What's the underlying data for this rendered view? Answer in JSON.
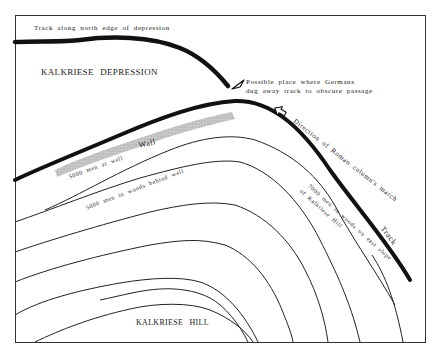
{
  "map": {
    "title": "Kalkriese battle site sketch map",
    "regions": {
      "depression": "KALKRIESE   DEPRESSION",
      "hill": "KALKRIESE   HILL"
    },
    "labels": {
      "north_track": "Track along north edge of depression",
      "possible_place_line1": "Possible place where Germans",
      "possible_place_line2": "dug away track to obscure passage",
      "direction": "Direction of Roman column's march",
      "track": "Track",
      "wall": "Wall",
      "men_at_wall": "5000 men at wall",
      "men_behind_wall": "5000 men in woods behind wall",
      "men_east_slope_line1": "7000 men in woods on east slope",
      "men_east_slope_line2": "of Kalkriese Hill"
    },
    "icons": {
      "pointer": "hollow-triangle-pointer-icon",
      "direction_arrow": "hollow-arrow-icon"
    },
    "colors": {
      "ink": "#111111",
      "wall_fill": "#bdbdbd",
      "frame": "#333333",
      "background": "#ffffff"
    }
  }
}
